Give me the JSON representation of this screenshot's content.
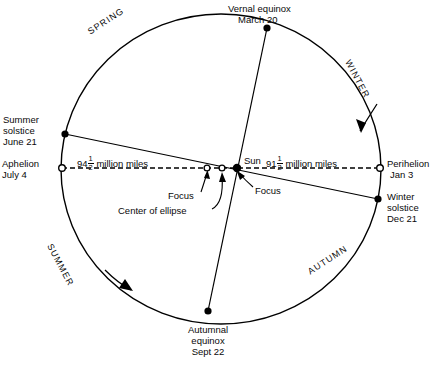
{
  "figure": {
    "type": "orbit-diagram"
  },
  "orbit_points": [
    {
      "id": "vernal-equinox",
      "name": "Vernal equinox",
      "date": "March 20",
      "marker": "filled",
      "x": 267,
      "y": 28,
      "label_x": 228,
      "label_y": 4,
      "align": "left"
    },
    {
      "id": "summer-solstice",
      "name": "Summer solstice",
      "date": "June 21",
      "marker": "filled",
      "x": 65,
      "y": 134,
      "label_x": 2,
      "label_y": 116,
      "align": "left"
    },
    {
      "id": "autumnal-equinox",
      "name": "Autumnal equinox",
      "date": "Sept 22",
      "marker": "filled",
      "x": 208,
      "y": 311,
      "label_x": 176,
      "label_y": 325,
      "align": "center"
    },
    {
      "id": "winter-solstice",
      "name": "Winter solstice",
      "date": "Dec 21",
      "marker": "filled",
      "x": 378,
      "y": 199,
      "label_x": 386,
      "label_y": 190,
      "align": "left"
    },
    {
      "id": "aphelion",
      "name": "Aphelion",
      "date": "July 4",
      "marker": "open",
      "x": 62,
      "y": 168,
      "label_x": 2,
      "label_y": 158,
      "align": "left"
    },
    {
      "id": "perihelion",
      "name": "Perihelion",
      "date": "Jan 3",
      "marker": "open",
      "x": 380,
      "y": 168,
      "label_x": 386,
      "label_y": 158,
      "align": "left"
    }
  ],
  "seasons": [
    {
      "id": "spring",
      "label": "SPRING",
      "x": 86,
      "y": 28,
      "rotate": -33
    },
    {
      "id": "winter",
      "label": "WINTER",
      "x": 350,
      "y": 58,
      "rotate": 62
    },
    {
      "id": "summer",
      "label": "SUMMER",
      "x": 52,
      "y": 242,
      "rotate": 62
    },
    {
      "id": "autumn",
      "label": "AUTUMN",
      "x": 308,
      "y": 265,
      "rotate": -33
    }
  ],
  "center_markers": [
    {
      "id": "sun",
      "name": "Sun",
      "marker": "filled",
      "x": 237,
      "y": 168
    },
    {
      "id": "center-of-ellipse",
      "name": "Center of ellipse",
      "marker": "open",
      "x": 222,
      "y": 168
    },
    {
      "id": "empty-focus",
      "name": "Focus",
      "marker": "open",
      "x": 207,
      "y": 168
    }
  ],
  "callouts": {
    "sun_label": "Sun",
    "focus_left": "Focus",
    "focus_right": "Focus",
    "center_of_ellipse": "Center of ellipse"
  },
  "distances": {
    "left": {
      "whole": "94",
      "num": "1",
      "den": "2",
      "unit": "million miles",
      "text": "94 1/2 million miles"
    },
    "right": {
      "whole": "91",
      "num": "1",
      "den": "2",
      "unit": "million miles",
      "text": "91 1/2 million miles"
    }
  },
  "colors": {
    "ink": "#000000",
    "background": "#ffffff"
  }
}
